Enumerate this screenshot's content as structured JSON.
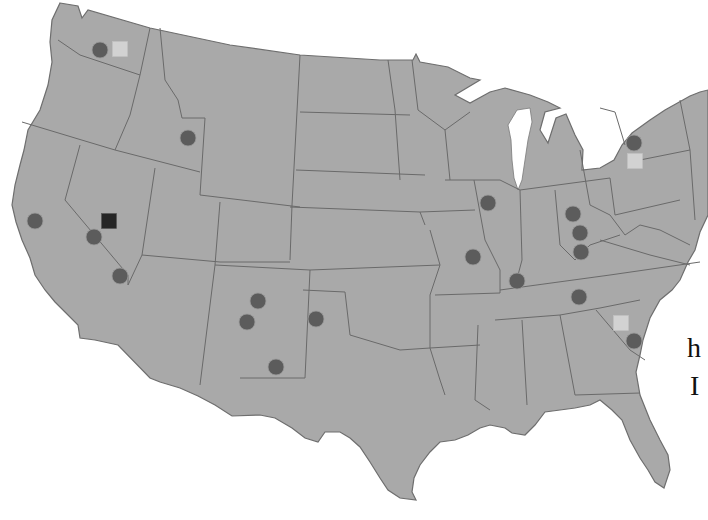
{
  "map": {
    "region": "Contiguous United States",
    "colors": {
      "land": "#a9a9a9",
      "borders": "#6a6a6a",
      "background": "#ffffff",
      "circle_marker": "#5c5c5c",
      "light_square_marker": "#d2d2d2",
      "dark_square_marker": "#262626"
    },
    "markers": [
      {
        "type": "circle",
        "x": 100,
        "y": 50
      },
      {
        "type": "square-light",
        "x": 120,
        "y": 49
      },
      {
        "type": "circle",
        "x": 188,
        "y": 138
      },
      {
        "type": "circle",
        "x": 35,
        "y": 221
      },
      {
        "type": "square-dark",
        "x": 109,
        "y": 221
      },
      {
        "type": "circle",
        "x": 94,
        "y": 237
      },
      {
        "type": "circle",
        "x": 120,
        "y": 276
      },
      {
        "type": "circle",
        "x": 258,
        "y": 301
      },
      {
        "type": "circle",
        "x": 247,
        "y": 322
      },
      {
        "type": "circle",
        "x": 316,
        "y": 319
      },
      {
        "type": "circle",
        "x": 276,
        "y": 367
      },
      {
        "type": "circle",
        "x": 488,
        "y": 203
      },
      {
        "type": "circle",
        "x": 473,
        "y": 257
      },
      {
        "type": "circle",
        "x": 517,
        "y": 281
      },
      {
        "type": "circle",
        "x": 573,
        "y": 214
      },
      {
        "type": "circle",
        "x": 580,
        "y": 233
      },
      {
        "type": "circle",
        "x": 581,
        "y": 252
      },
      {
        "type": "circle",
        "x": 579,
        "y": 297
      },
      {
        "type": "circle",
        "x": 634,
        "y": 143
      },
      {
        "type": "square-light",
        "x": 635,
        "y": 161
      },
      {
        "type": "square-light",
        "x": 621,
        "y": 323
      },
      {
        "type": "circle",
        "x": 634,
        "y": 341
      }
    ]
  },
  "edge_text": {
    "line1": "h",
    "line2": "I"
  }
}
